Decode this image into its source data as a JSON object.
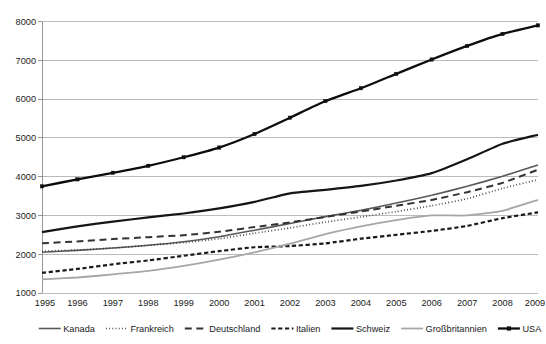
{
  "chart_data": {
    "type": "line",
    "title": "",
    "subtitle": "",
    "xlabel": "",
    "ylabel": "",
    "categories": [
      "1995",
      "1996",
      "1997",
      "1998",
      "1999",
      "2000",
      "2001",
      "2002",
      "2003",
      "2004",
      "2005",
      "2006",
      "2007",
      "2008",
      "2009"
    ],
    "x_tick_labels": [
      "1995",
      "1996",
      "1997",
      "1998",
      "1999",
      "2000",
      "2001",
      "2002",
      "2003",
      "2004",
      "2005",
      "2006",
      "2007",
      "2008",
      "2009"
    ],
    "y_tick_labels": [
      "1000",
      "2000",
      "3000",
      "4000",
      "5000",
      "6000",
      "7000",
      "8000"
    ],
    "y_ticks": [
      1000,
      2000,
      3000,
      4000,
      5000,
      6000,
      7000,
      8000
    ],
    "ylim": [
      1000,
      8000
    ],
    "xlim": [
      "1995",
      "2009"
    ],
    "grid": "horizontal",
    "legend_position": "bottom",
    "series": [
      {
        "name": "Kanada",
        "color": "#595959",
        "style": "solid",
        "width": 1.6,
        "marker": "none",
        "values": [
          2050,
          2100,
          2160,
          2230,
          2320,
          2450,
          2620,
          2790,
          2970,
          3130,
          3320,
          3520,
          3750,
          4010,
          4300
        ]
      },
      {
        "name": "Frankreich",
        "color": "#3f3f3f",
        "style": "dotted",
        "width": 1.7,
        "marker": "none",
        "values": [
          2080,
          2110,
          2160,
          2230,
          2300,
          2400,
          2540,
          2680,
          2830,
          2960,
          3100,
          3250,
          3430,
          3700,
          3920
        ]
      },
      {
        "name": "Deutschland",
        "color": "#333333",
        "style": "dashed-long",
        "width": 2.0,
        "marker": "none",
        "values": [
          2280,
          2330,
          2390,
          2440,
          2490,
          2580,
          2700,
          2820,
          2960,
          3100,
          3250,
          3400,
          3600,
          3840,
          4180
        ]
      },
      {
        "name": "Italien",
        "color": "#1a1a1a",
        "style": "dashed-short",
        "width": 2.2,
        "marker": "none",
        "values": [
          1520,
          1620,
          1740,
          1840,
          1960,
          2080,
          2180,
          2210,
          2280,
          2400,
          2500,
          2600,
          2730,
          2930,
          3080
        ]
      },
      {
        "name": "Schweiz",
        "color": "#151515",
        "style": "solid",
        "width": 2.2,
        "marker": "none",
        "values": [
          2570,
          2720,
          2840,
          2950,
          3050,
          3180,
          3350,
          3570,
          3660,
          3760,
          3900,
          4090,
          4450,
          4850,
          5080
        ]
      },
      {
        "name": "Großbritannien",
        "color": "#a6a6a6",
        "style": "solid",
        "width": 1.8,
        "marker": "none",
        "values": [
          1350,
          1400,
          1480,
          1570,
          1700,
          1860,
          2050,
          2270,
          2520,
          2720,
          2880,
          3000,
          3000,
          3120,
          3400
        ]
      },
      {
        "name": "USA",
        "color": "#0d0d0d",
        "style": "solid",
        "width": 2.3,
        "marker": "square",
        "values": [
          3750,
          3930,
          4100,
          4280,
          4500,
          4750,
          5100,
          5520,
          5950,
          6280,
          6650,
          7020,
          7370,
          7680,
          7900
        ]
      }
    ]
  },
  "legend": {
    "items": [
      {
        "label": "Kanada"
      },
      {
        "label": "Frankreich"
      },
      {
        "label": "Deutschland"
      },
      {
        "label": "Italien"
      },
      {
        "label": "Schweiz"
      },
      {
        "label": "Großbritannien"
      },
      {
        "label": "USA"
      }
    ]
  },
  "colors": {
    "gridline": "#b4b4b4",
    "text": "#1a1a1a",
    "background": "#ffffff"
  }
}
